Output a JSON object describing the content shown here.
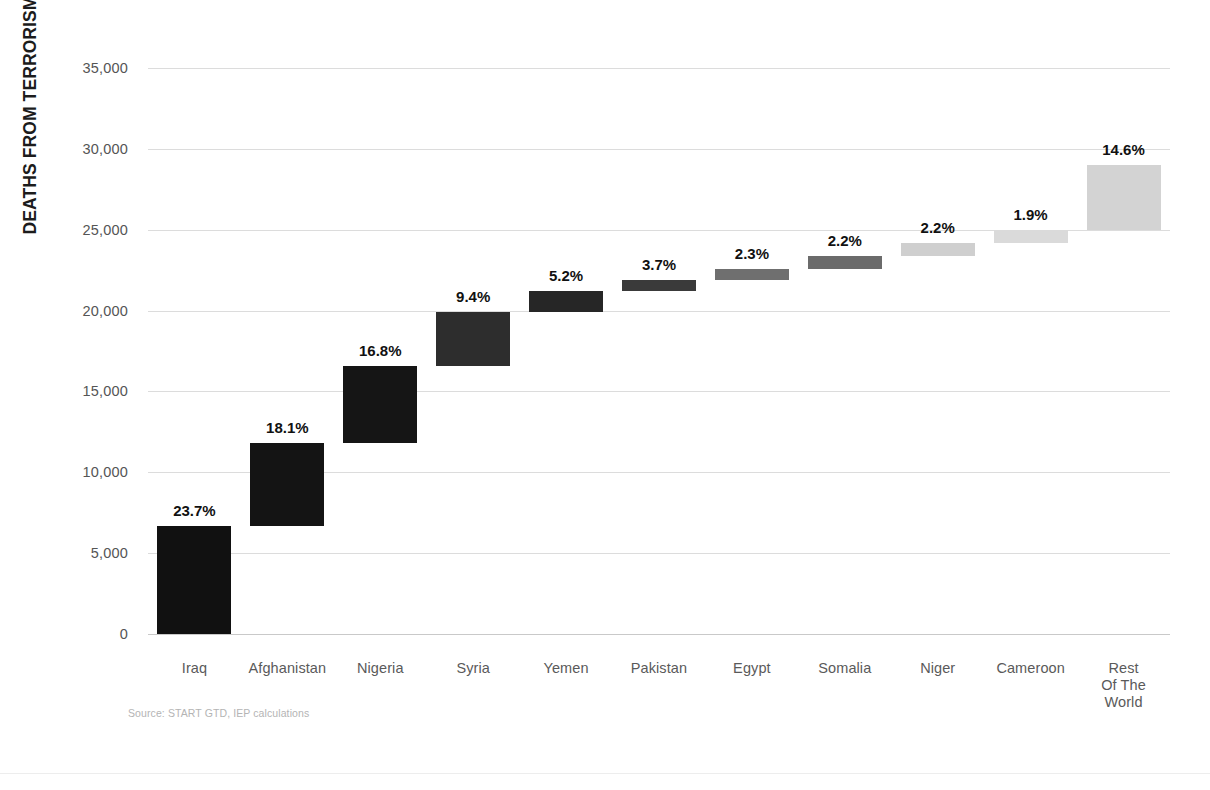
{
  "axis": {
    "y_title": "DEATHS FROM TERRORISM",
    "y_ticks": [
      "35,000",
      "30,000",
      "25,000",
      "20,000",
      "15,000",
      "10,000",
      "5,000",
      "0"
    ]
  },
  "source": {
    "text": "Source: START GTD, IEP calculations"
  },
  "chart_data": {
    "type": "bar",
    "subtype": "waterfall-cumulative",
    "title": "",
    "xlabel": "",
    "ylabel": "DEATHS FROM TERRORISM",
    "ylim": [
      0,
      35000
    ],
    "ytick_values": [
      0,
      5000,
      10000,
      15000,
      20000,
      25000,
      30000,
      35000
    ],
    "ytick_labels": [
      "0",
      "5,000",
      "10,000",
      "15,000",
      "20,000",
      "25,000",
      "30,000",
      "35,000"
    ],
    "grid": true,
    "legend": "none",
    "categories": [
      "Iraq",
      "Afghanistan",
      "Nigeria",
      "Syria",
      "Yemen",
      "Pakistan",
      "Egypt",
      "Somalia",
      "Niger",
      "Cameroon",
      "Rest Of The World"
    ],
    "category_label_lines": [
      [
        "Iraq"
      ],
      [
        "Afghanistan"
      ],
      [
        "Nigeria"
      ],
      [
        "Syria"
      ],
      [
        "Yemen"
      ],
      [
        "Pakistan"
      ],
      [
        "Egypt"
      ],
      [
        "Somalia"
      ],
      [
        "Niger"
      ],
      [
        "Cameroon"
      ],
      [
        "Rest",
        "Of The",
        "World"
      ]
    ],
    "data_labels": [
      "23.7%",
      "18.1%",
      "16.8%",
      "9.4%",
      "5.2%",
      "3.7%",
      "2.3%",
      "2.2%",
      "2.2%",
      "1.9%",
      "14.6%"
    ],
    "percentages": [
      23.7,
      18.1,
      16.8,
      9.4,
      5.2,
      3.7,
      2.3,
      2.2,
      2.2,
      1.9,
      14.6
    ],
    "values": [
      6700,
      5100,
      4800,
      3300,
      1300,
      700,
      650,
      850,
      800,
      800,
      4000
    ],
    "cumulative_start": [
      0,
      6700,
      11800,
      16600,
      19900,
      21200,
      21900,
      22550,
      23400,
      24200,
      25000
    ],
    "cumulative_end": [
      6700,
      11800,
      16600,
      19900,
      21200,
      21900,
      22550,
      23400,
      24200,
      25000,
      29000
    ],
    "bar_colors": [
      "#111111",
      "#141414",
      "#151515",
      "#2d2d2d",
      "#262626",
      "#3a3a3a",
      "#6f6f6f",
      "#6b6b6b",
      "#cfcfcf",
      "#dadada",
      "#d3d3d3"
    ]
  }
}
